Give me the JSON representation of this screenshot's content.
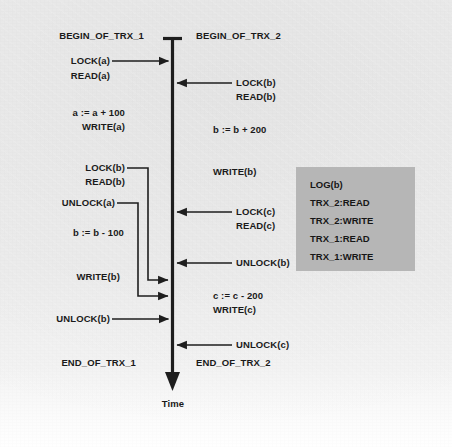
{
  "diagram": {
    "axis_label": "Time",
    "colors": {
      "ink": "#1a1a1a",
      "paper": "#ededed",
      "log_box": "#b6b6b6"
    }
  },
  "trx1": {
    "begin": "BEGIN_OF_TRX_1",
    "end": "END_OF_TRX_1",
    "events": [
      {
        "text": "LOCK(a)",
        "kind": "arrow-to-axis"
      },
      {
        "text": "READ(a)",
        "kind": "text-only"
      },
      {
        "text": "a := a + 100",
        "kind": "text-only"
      },
      {
        "text": "WRITE(a)",
        "kind": "text-only"
      },
      {
        "text": "LOCK(b)",
        "kind": "deferred-arrow"
      },
      {
        "text": "READ(b)",
        "kind": "text-only"
      },
      {
        "text": "UNLOCK(a)",
        "kind": "deferred-arrow"
      },
      {
        "text": "b := b - 100",
        "kind": "text-only"
      },
      {
        "text": "WRITE(b)",
        "kind": "text-only"
      },
      {
        "text": "UNLOCK(b)",
        "kind": "arrow-to-axis"
      }
    ]
  },
  "trx2": {
    "begin": "BEGIN_OF_TRX_2",
    "end": "END_OF_TRX_2",
    "events": [
      {
        "text": "LOCK(b)",
        "kind": "arrow-to-axis"
      },
      {
        "text": "READ(b)",
        "kind": "text-only"
      },
      {
        "text": "b := b + 200",
        "kind": "text-only"
      },
      {
        "text": "WRITE(b)",
        "kind": "text-only"
      },
      {
        "text": "LOCK(c)",
        "kind": "arrow-to-axis"
      },
      {
        "text": "READ(c)",
        "kind": "text-only"
      },
      {
        "text": "UNLOCK(b)",
        "kind": "arrow-to-axis"
      },
      {
        "text": "c := c - 200",
        "kind": "text-only"
      },
      {
        "text": "WRITE(c)",
        "kind": "text-only"
      },
      {
        "text": "UNLOCK(c)",
        "kind": "arrow-to-axis"
      }
    ]
  },
  "log": {
    "entries": [
      "LOG(b)",
      "TRX_2:READ",
      "TRX_2:WRITE",
      "TRX_1:READ",
      "TRX_1:WRITE"
    ]
  }
}
